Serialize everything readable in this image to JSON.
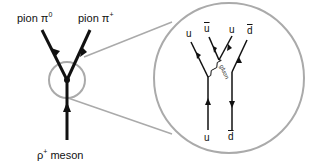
{
  "labels": {
    "pion_pi0": "pion π",
    "pion_pi0_sup": "0",
    "pion_piplus": "pion π",
    "pion_piplus_sup": "+",
    "rho_meson": "ρ",
    "rho_sup": "+",
    "rho_tail": " meson"
  },
  "zoom": {
    "top_left": "u",
    "top_ubar": "u",
    "top_u": "u",
    "top_dbar": "d",
    "bottom_u": "u",
    "bottom_dbar": "d",
    "gluon": "gluon"
  },
  "colors": {
    "line": "#111111",
    "circle": "#aaaaaa"
  }
}
